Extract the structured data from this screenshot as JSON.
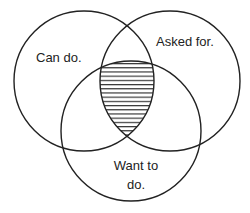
{
  "diagram": {
    "type": "venn",
    "colors": {
      "stroke": "#222222",
      "background": "#ffffff",
      "hatch": "#222222"
    },
    "sets": [
      {
        "id": "can-do",
        "label": "Can do.",
        "cx": 84,
        "cy": 81,
        "r": 70
      },
      {
        "id": "asked-for",
        "label": "Asked for.",
        "cx": 170,
        "cy": 81,
        "r": 70
      },
      {
        "id": "want-to-do",
        "label_line1": "Want to",
        "label_line2": "do.",
        "cx": 131,
        "cy": 131,
        "r": 70
      }
    ],
    "highlight": {
      "region": "intersection of all three",
      "pattern": "horizontal-hatch"
    }
  }
}
